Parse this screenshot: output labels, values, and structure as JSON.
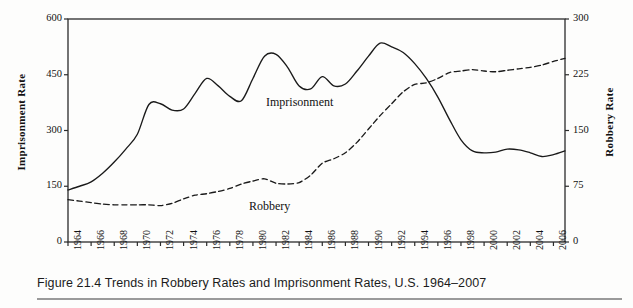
{
  "figure": {
    "caption": "Figure 21.4 Trends in Robbery Rates and Imprisonment Rates, U.S. 1964–2007"
  },
  "chart_data": {
    "type": "line",
    "title": "",
    "xlabel": "",
    "ylabel": "Imprisonment Rate",
    "y2label": "Robbery Rate",
    "grid": false,
    "legend_position": "inline-annotations",
    "xlim": [
      1964,
      2007
    ],
    "ylim": [
      0,
      600
    ],
    "y2lim": [
      0,
      300
    ],
    "yticks": [
      0,
      150,
      300,
      450,
      600
    ],
    "y2ticks": [
      0,
      75,
      150,
      225,
      300
    ],
    "xticks": [
      1964,
      1966,
      1968,
      1970,
      1972,
      1974,
      1976,
      1978,
      1980,
      1982,
      1984,
      1986,
      1988,
      1990,
      1992,
      1994,
      1996,
      1998,
      2000,
      2002,
      2004,
      2006
    ],
    "x": [
      1964,
      1965,
      1966,
      1967,
      1968,
      1969,
      1970,
      1971,
      1972,
      1973,
      1974,
      1975,
      1976,
      1977,
      1978,
      1979,
      1980,
      1981,
      1982,
      1983,
      1984,
      1985,
      1986,
      1987,
      1988,
      1989,
      1990,
      1991,
      1992,
      1993,
      1994,
      1995,
      1996,
      1997,
      1998,
      1999,
      2000,
      2001,
      2002,
      2003,
      2004,
      2005,
      2006,
      2007
    ],
    "series": [
      {
        "name": "Imprisonment",
        "axis": "left",
        "style": "solid",
        "color": "#1a1a1a",
        "label_text": "Imprisonment",
        "values": [
          140,
          150,
          162,
          185,
          215,
          250,
          290,
          370,
          372,
          355,
          358,
          400,
          440,
          420,
          392,
          380,
          440,
          500,
          505,
          470,
          420,
          412,
          445,
          420,
          425,
          460,
          500,
          535,
          525,
          510,
          480,
          440,
          390,
          330,
          275,
          245,
          240,
          242,
          250,
          248,
          240,
          230,
          235,
          245
        ]
      },
      {
        "name": "Robbery",
        "axis": "right",
        "style": "dashed",
        "color": "#1a1a1a",
        "label_text": "Robbery",
        "values": [
          57,
          55,
          53,
          51,
          50,
          50,
          50,
          50,
          49,
          52,
          58,
          63,
          65,
          68,
          72,
          78,
          82,
          85,
          79,
          78,
          80,
          90,
          106,
          112,
          120,
          134,
          152,
          170,
          186,
          202,
          212,
          214,
          220,
          228,
          230,
          232,
          230,
          229,
          231,
          233,
          235,
          238,
          243,
          247
        ]
      }
    ],
    "annotations": [
      {
        "text": "Imprisonment",
        "x": 1982,
        "y": 400
      },
      {
        "text": "Robbery",
        "x": 1981,
        "y": 60
      }
    ]
  }
}
